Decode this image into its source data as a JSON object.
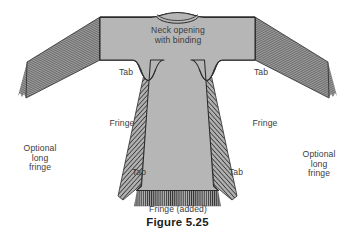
{
  "figure": {
    "caption": "Figure 5.25",
    "background_color": "#ffffff",
    "garment_fill": "#b3b3b3",
    "garment_fill_light": "#bdbdbd",
    "outline_color": "#2b2b2b",
    "fringe_color": "#4a4a4a",
    "label_color": "#3b3b3b",
    "caption_color": "#1c1c1c"
  },
  "labels": {
    "neck": "Neck opening\nwith binding",
    "tab_upper_left": "Tab",
    "tab_upper_right": "Tab",
    "tab_lower_left": "Tab",
    "tab_lower_right": "Tab",
    "fringe_left": "Fringe",
    "fringe_right": "Fringe",
    "fringe_added": "Fringe (added)",
    "optional_fringe_left": "Optional\nlong\nfringe",
    "optional_fringe_right": "Optional\nlong\nfringe"
  },
  "parts": {
    "left_sleeve": "left sleeve with long diagonal fringe",
    "right_sleeve": "right sleeve with long diagonal fringe",
    "body_panel": "center body panel",
    "left_side_fringe_panel": "left hatched side fringe panel",
    "right_side_fringe_panel": "right hatched side fringe panel",
    "hem_fringe": "added vertical fringe along bottom hem",
    "neck_binding": "bound neck opening arc"
  }
}
